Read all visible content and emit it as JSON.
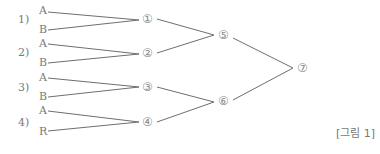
{
  "diagram": {
    "groups": [
      {
        "label": "1)",
        "a": "A",
        "b": "B",
        "node": "①"
      },
      {
        "label": "2)",
        "a": "A",
        "b": "B",
        "node": "②"
      },
      {
        "label": "3)",
        "a": "A",
        "b": "B",
        "node": "③"
      },
      {
        "label": "4)",
        "a": "A",
        "b": "R",
        "node": "④"
      }
    ],
    "level2": [
      "⑤",
      "⑥"
    ],
    "root": "⑦",
    "caption": "[그림 1]",
    "line_color": "#6e6e6e"
  }
}
